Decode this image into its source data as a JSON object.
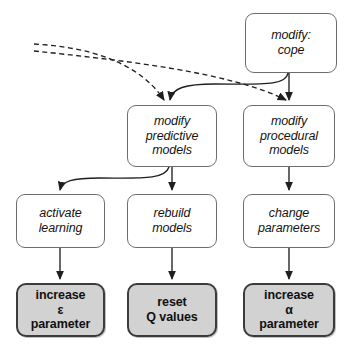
{
  "diagram": {
    "colors": {
      "background": "#ffffff",
      "node_fill": "#ffffff",
      "node_border": "#6d6d6d",
      "emphasis_fill": "#d2d2d2",
      "emphasis_border": "#3b3b3b",
      "edge": "#1f1f1f"
    },
    "nodes": [
      {
        "id": "modify-cope",
        "label": "modify:\ncope",
        "style": "plain",
        "x": 245,
        "y": 13,
        "w": 92,
        "h": 60
      },
      {
        "id": "modify-predictive-models",
        "label": "modify\npredictive\nmodels",
        "style": "plain",
        "x": 127,
        "y": 105,
        "w": 90,
        "h": 62
      },
      {
        "id": "modify-procedural-models",
        "label": "modify\nprocedural\nmodels",
        "style": "plain",
        "x": 243,
        "y": 105,
        "w": 92,
        "h": 62
      },
      {
        "id": "activate-learning",
        "label": "activate\nlearning",
        "style": "plain",
        "x": 16,
        "y": 194,
        "w": 89,
        "h": 54
      },
      {
        "id": "rebuild-models",
        "label": "rebuild\nmodels",
        "style": "plain",
        "x": 127,
        "y": 194,
        "w": 90,
        "h": 54
      },
      {
        "id": "change-parameters",
        "label": "change\nparameters",
        "style": "plain",
        "x": 243,
        "y": 194,
        "w": 92,
        "h": 54
      },
      {
        "id": "increase-epsilon-parameter",
        "label": "increase\nε\nparameter",
        "style": "emphasis",
        "x": 16,
        "y": 283,
        "w": 89,
        "h": 54
      },
      {
        "id": "reset-q-values",
        "label": "reset\nQ values",
        "style": "emphasis",
        "x": 127,
        "y": 283,
        "w": 90,
        "h": 54
      },
      {
        "id": "increase-alpha-parameter",
        "label": "increase\nα\nparameter",
        "style": "emphasis",
        "x": 243,
        "y": 283,
        "w": 92,
        "h": 54
      }
    ],
    "edges": [
      {
        "id": "dashed-to-predictive",
        "from": "external-left",
        "to": "modify-predictive-models",
        "style": "dashed",
        "path": "M 34 44 C 90 47 140 63 164 100"
      },
      {
        "id": "dashed-to-procedural",
        "from": "external-left",
        "to": "modify-procedural-models",
        "style": "dashed",
        "path": "M 34 51 C 120 60 230 72 286 100"
      },
      {
        "id": "cope-to-predictive",
        "from": "modify-cope",
        "to": "modify-predictive-models",
        "style": "solid",
        "path": "M 288 73 C 286 86 262 84 215 84 C 185 84 172 88 170 100"
      },
      {
        "id": "cope-to-procedural",
        "from": "modify-cope",
        "to": "modify-procedural-models",
        "style": "solid",
        "path": "M 289 73 L 289 100"
      },
      {
        "id": "predictive-to-activate",
        "from": "modify-predictive-models",
        "to": "activate-learning",
        "style": "solid",
        "path": "M 169 167 C 165 180 140 178 100 178 C 72 178 62 181 60 190"
      },
      {
        "id": "predictive-to-rebuild",
        "from": "modify-predictive-models",
        "to": "rebuild-models",
        "style": "solid",
        "path": "M 172 167 L 172 190"
      },
      {
        "id": "procedural-to-change",
        "from": "modify-procedural-models",
        "to": "change-parameters",
        "style": "solid",
        "path": "M 289 167 L 289 190"
      },
      {
        "id": "activate-to-increase-epsilon",
        "from": "activate-learning",
        "to": "increase-epsilon-parameter",
        "style": "solid",
        "path": "M 60 248 L 60 279"
      },
      {
        "id": "rebuild-to-reset-q",
        "from": "rebuild-models",
        "to": "reset-q-values",
        "style": "solid",
        "path": "M 172 248 L 172 279"
      },
      {
        "id": "change-to-increase-alpha",
        "from": "change-parameters",
        "to": "increase-alpha-parameter",
        "style": "solid",
        "path": "M 289 248 L 289 279"
      }
    ]
  }
}
